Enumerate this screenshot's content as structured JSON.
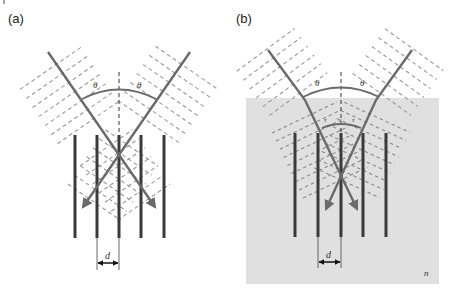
{
  "panels": [
    {
      "id": "a",
      "label": "(a)",
      "angle_labels": [
        "θ",
        "θ"
      ],
      "spacing_label": "d",
      "medium": false,
      "plane_count": 5
    },
    {
      "id": "b",
      "label": "(b)",
      "angle_labels": [
        "θ",
        "θ"
      ],
      "refracted_angle_labels": [
        "τ",
        "τ"
      ],
      "spacing_label": "d",
      "medium": true,
      "medium_label": "n",
      "plane_count": 5
    }
  ],
  "colors": {
    "medium_fill": "#e0e0e0",
    "ray": "#6a6a6a",
    "planes": "#3a3a3a",
    "wavefronts": "#9a9a9a"
  }
}
